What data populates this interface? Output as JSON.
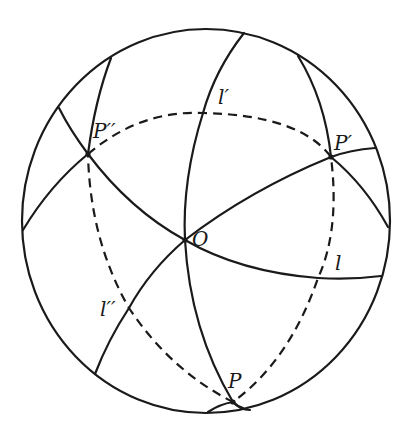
{
  "diagram": {
    "colors": {
      "stroke": "#1a1a1a",
      "background": "#ffffff"
    },
    "sphere": {
      "cx": 206,
      "cy": 221,
      "rx": 184,
      "ry": 192
    },
    "points": {
      "O": {
        "label": "O",
        "x": 185,
        "y": 240
      },
      "P": {
        "label": "P",
        "x": 233,
        "y": 402
      },
      "P_prime": {
        "label": "P′",
        "x": 331,
        "y": 157
      },
      "P_double_prime": {
        "label": "P′′",
        "x": 88,
        "y": 154
      }
    },
    "lines": {
      "l": {
        "label": "l"
      },
      "l_prime": {
        "label": "l′"
      },
      "l_double_prime": {
        "label": "l′′"
      }
    }
  }
}
